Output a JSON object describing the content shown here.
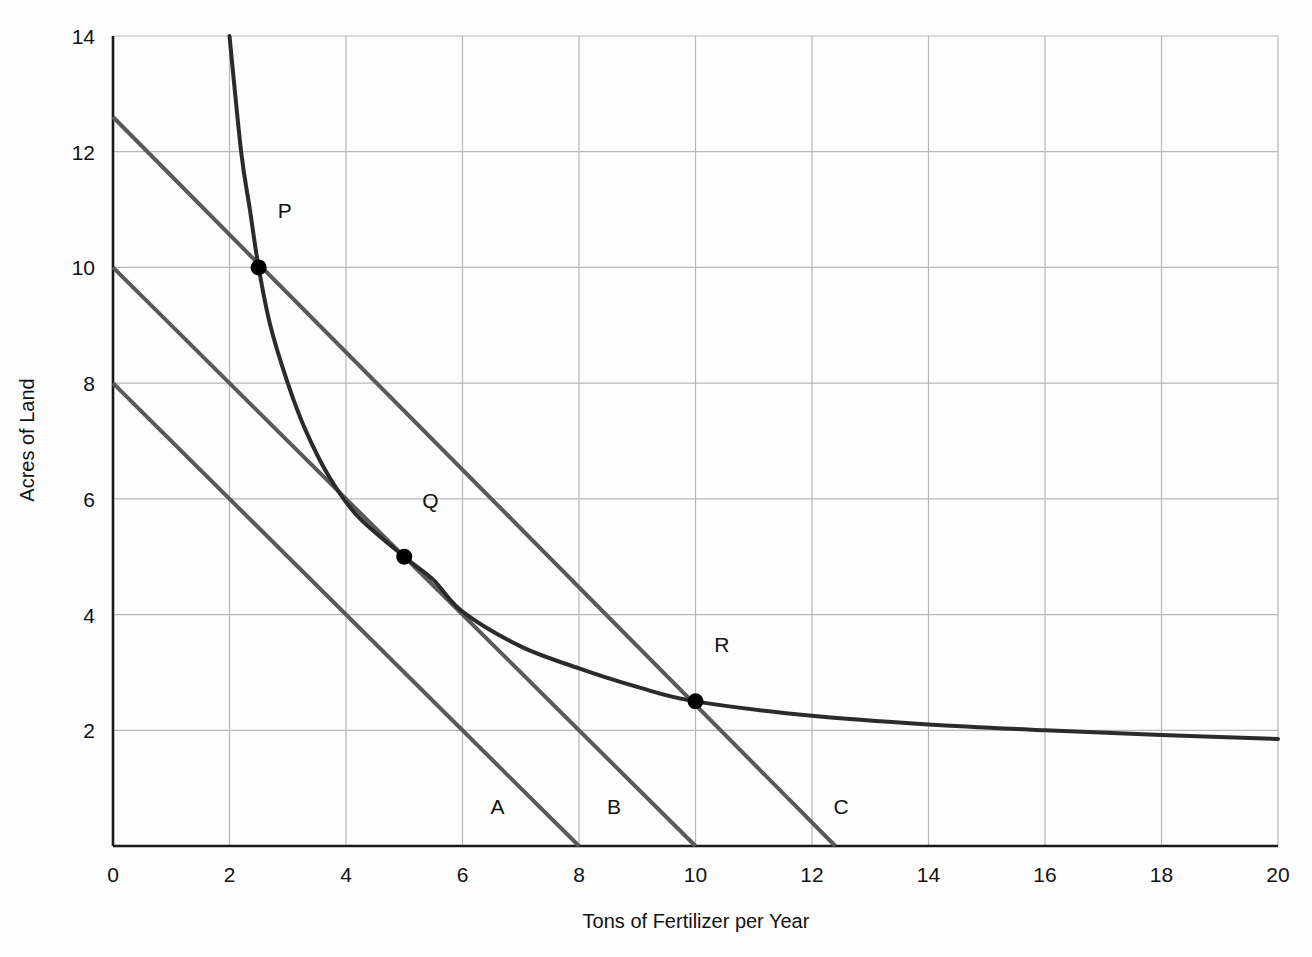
{
  "chart_data": {
    "type": "line",
    "title": "",
    "xlabel": "Tons of Fertilizer per Year",
    "ylabel": "Acres of Land",
    "xlim": [
      0,
      20
    ],
    "ylim": [
      0,
      14
    ],
    "grid": true,
    "legend": "none",
    "x_ticks": [
      0,
      2,
      4,
      6,
      8,
      10,
      12,
      14,
      16,
      18,
      20
    ],
    "x_tick_labels": [
      "0",
      "2",
      "4",
      "6",
      "8",
      "10",
      "12",
      "14",
      "16",
      "18",
      "20"
    ],
    "y_ticks": [
      2,
      4,
      6,
      8,
      10,
      12,
      14
    ],
    "y_tick_labels": [
      "2",
      "4",
      "6",
      "8",
      "10",
      "12",
      "14"
    ],
    "series": [
      {
        "name": "isoquant",
        "type": "curve",
        "color": "#2b2b2b",
        "width": 4,
        "points": [
          [
            2.0,
            14.0
          ],
          [
            2.2,
            12.0
          ],
          [
            2.35,
            11.0
          ],
          [
            2.5,
            10.0
          ],
          [
            2.7,
            9.0
          ],
          [
            3.0,
            8.0
          ],
          [
            3.3,
            7.2
          ],
          [
            3.7,
            6.4
          ],
          [
            4.2,
            5.7
          ],
          [
            5.0,
            5.0
          ],
          [
            5.5,
            4.6
          ],
          [
            6.0,
            4.05
          ],
          [
            7.0,
            3.45
          ],
          [
            8.0,
            3.07
          ],
          [
            9.0,
            2.75
          ],
          [
            10.0,
            2.5
          ],
          [
            12.0,
            2.25
          ],
          [
            14.0,
            2.1
          ],
          [
            16.0,
            2.0
          ],
          [
            18.0,
            1.92
          ],
          [
            20.0,
            1.85
          ]
        ]
      },
      {
        "name": "isocost-A",
        "type": "line",
        "color": "#595959",
        "width": 4,
        "label": "A",
        "label_x": 6.6,
        "label_y": 0.55,
        "y_intercept": 8.0,
        "x_intercept": 8.0,
        "points": [
          [
            0.0,
            8.0
          ],
          [
            8.0,
            0.0
          ]
        ]
      },
      {
        "name": "isocost-B",
        "type": "line",
        "color": "#595959",
        "width": 4,
        "label": "B",
        "label_x": 8.6,
        "label_y": 0.55,
        "y_intercept": 10.0,
        "x_intercept": 10.0,
        "points": [
          [
            0.0,
            10.0
          ],
          [
            10.0,
            0.0
          ]
        ]
      },
      {
        "name": "isocost-C",
        "type": "line",
        "color": "#595959",
        "width": 4,
        "label": "C",
        "label_x": 12.5,
        "label_y": 0.55,
        "y_intercept": 12.6,
        "x_intercept": 12.4,
        "points": [
          [
            0.0,
            12.6
          ],
          [
            12.4,
            0.0
          ]
        ]
      }
    ],
    "annotations": [
      {
        "name": "P",
        "x": 2.5,
        "y": 10.0,
        "label_dx": 0.45,
        "label_dy": 0.85
      },
      {
        "name": "Q",
        "x": 5.0,
        "y": 5.0,
        "label_dx": 0.45,
        "label_dy": 0.85
      },
      {
        "name": "R",
        "x": 10.0,
        "y": 2.5,
        "label_dx": 0.45,
        "label_dy": 0.85
      }
    ]
  },
  "colors": {
    "curve": "#2b2b2b",
    "isocost": "#595959",
    "grid": "#b8b8b8",
    "axis": "#1a1a1a",
    "point": "#000000",
    "background": "#fdfdfd"
  }
}
